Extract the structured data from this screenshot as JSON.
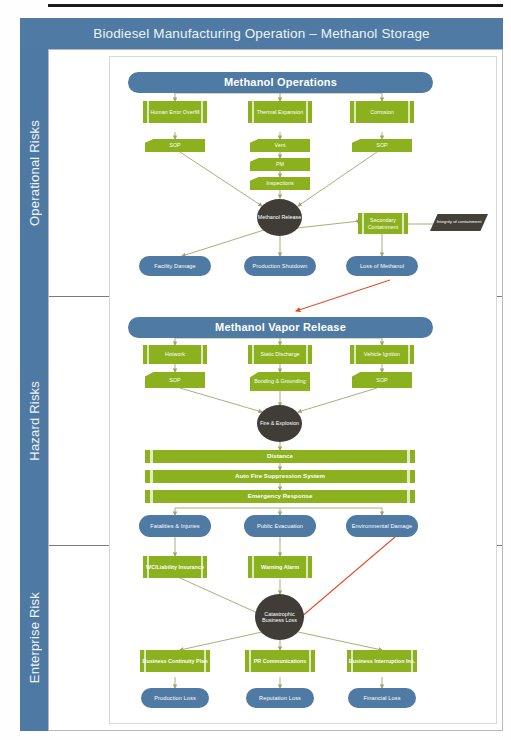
{
  "header": {
    "title": "Biodiesel Manufacturing Operation – Methanol Storage"
  },
  "swimlanes": [
    {
      "label": "Operational Risks"
    },
    {
      "label": "Hazard Risks"
    },
    {
      "label": "Enterprise Risk"
    }
  ],
  "colors": {
    "blue": "#4e7aa4",
    "green": "#8cb11e",
    "dark": "#403d38",
    "red_arrow": "#e2502a",
    "wire": "#9aa86a"
  },
  "operational": {
    "title": "Methanol Operations",
    "causes": [
      {
        "label": "Human Error Overfill"
      },
      {
        "label": "Thermal Expansion"
      },
      {
        "label": "Corrosion"
      }
    ],
    "controls": [
      {
        "label": "SOP"
      },
      {
        "label": "Vent"
      },
      {
        "label": "PM"
      },
      {
        "label": "Inspections"
      },
      {
        "label": "SOP"
      }
    ],
    "event": "Methanol Release",
    "mitigation": "Secondary Containment",
    "mitigation_input": "Integrity of containment",
    "consequences": [
      {
        "label": "Facility Damage"
      },
      {
        "label": "Production Shutdown"
      },
      {
        "label": "Loss of Methanol"
      }
    ]
  },
  "hazard": {
    "title": "Methanol Vapor Release",
    "causes": [
      {
        "label": "Hotwork"
      },
      {
        "label": "Static Discharge"
      },
      {
        "label": "Vehicle Ignition"
      }
    ],
    "controls": [
      {
        "label": "SOP"
      },
      {
        "label": "Bonding & Grounding"
      },
      {
        "label": "SOP"
      }
    ],
    "event": "Fire & Explosion",
    "barriers": [
      {
        "label": "Distance"
      },
      {
        "label": "Auto Fire Suppression System"
      },
      {
        "label": "Emergency Response"
      }
    ],
    "consequences": [
      {
        "label": "Fatalities & Injuries"
      },
      {
        "label": "Public Evacuation"
      },
      {
        "label": "Environmental Damage"
      }
    ]
  },
  "enterprise": {
    "controls": [
      {
        "label": "WC/Liability Insurance"
      },
      {
        "label": "Warning Alarm"
      }
    ],
    "event": "Catastrophic Business Loss",
    "recoveries": [
      {
        "label": "Business Continuity Plan"
      },
      {
        "label": "PR Communications"
      },
      {
        "label": "Business Interruption Ins."
      }
    ],
    "consequences": [
      {
        "label": "Production Loss"
      },
      {
        "label": "Reputation Loss"
      },
      {
        "label": "Financial Loss"
      }
    ]
  }
}
